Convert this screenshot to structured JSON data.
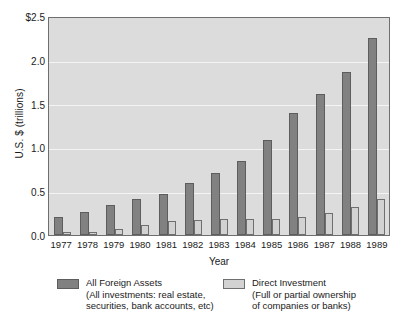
{
  "chart_data": {
    "type": "bar",
    "title": "",
    "xlabel": "Year",
    "ylabel": "U.S. $ (trillions)",
    "categories": [
      "1977",
      "1978",
      "1979",
      "1980",
      "1981",
      "1982",
      "1983",
      "1984",
      "1985",
      "1986",
      "1987",
      "1988",
      "1989"
    ],
    "ylim": [
      0,
      2.5
    ],
    "ytick_labels": [
      "$2.5",
      "2.0",
      "1.5",
      "1.0",
      "0.5",
      "0.0"
    ],
    "ytick_values": [
      2.5,
      2.0,
      1.5,
      1.0,
      0.5,
      0.0
    ],
    "grid": true,
    "legend_position": "bottom",
    "series": [
      {
        "name": "All Foreign Assets",
        "description": "(All investments: real estate, securities, bank accounts, etc)",
        "color": "#818181",
        "values": [
          0.21,
          0.27,
          0.35,
          0.41,
          0.47,
          0.6,
          0.72,
          0.85,
          1.09,
          1.41,
          1.62,
          1.88,
          2.27
        ]
      },
      {
        "name": "Direct Investment",
        "description": "(Full or partial ownership of companies or banks)",
        "color": "#d2d2d2",
        "values": [
          0.03,
          0.04,
          0.07,
          0.12,
          0.16,
          0.17,
          0.18,
          0.18,
          0.18,
          0.21,
          0.25,
          0.32,
          0.42
        ]
      }
    ]
  },
  "legend": {
    "items": [
      {
        "label": "All Foreign Assets",
        "sub_line_1": "(All investments: real estate,",
        "sub_line_2": "securities, bank accounts, etc)"
      },
      {
        "label": "Direct Investment",
        "sub_line_1": "(Full or partial ownership",
        "sub_line_2": "of companies or banks)"
      }
    ]
  }
}
